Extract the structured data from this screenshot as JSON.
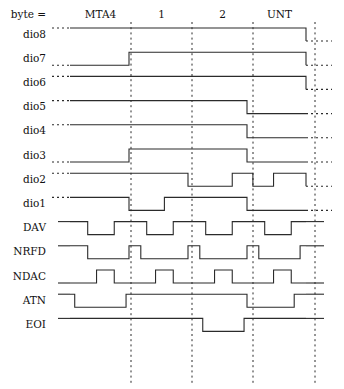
{
  "diagram": {
    "byte_header_label": "byte =",
    "byte_labels": [
      "MTA4",
      "1",
      "2",
      "UNT"
    ],
    "signal_labels": [
      "dio8",
      "dio7",
      "dio6",
      "dio5",
      "dio4",
      "dio3",
      "dio2",
      "dio1",
      "DAV",
      "NRFD",
      "NDAC",
      "ATN",
      "EOI"
    ],
    "colors": {
      "background": "#ffffff",
      "trace": "#2b2b2b",
      "text": "#111111",
      "divider": "#2b2b2b"
    },
    "geometry": {
      "wave_start_x": 70,
      "wave_end_x": 306,
      "lead_start_x": 52,
      "trail_end_x": 332,
      "byte_boundaries": [
        70,
        131,
        192,
        253,
        306
      ],
      "divider_x": [
        131,
        192,
        253,
        315
      ],
      "row_height": 24.2,
      "first_row_y": 41,
      "header_y": 15,
      "label_right_x": 46,
      "amplitude": 13
    },
    "chart_data": {
      "type": "line",
      "title": "GPIB bus signal timing",
      "xlabel": "byte",
      "ylabel": "signal",
      "categories": [
        "MTA4",
        "1",
        "2",
        "UNT"
      ],
      "note": "Each signal is a digital waveform. Transitions given as fractional position across the 4-byte span (0 = start, 4 = end); level 1 = high, 0 = low.",
      "series": [
        {
          "name": "dio8",
          "levels": [
            1,
            1,
            1,
            1
          ],
          "transitions": [
            [
              0,
              1
            ],
            [
              4,
              0
            ]
          ]
        },
        {
          "name": "dio7",
          "levels": [
            0,
            1,
            1,
            1
          ],
          "transitions": [
            [
              0,
              0
            ],
            [
              1,
              1
            ],
            [
              4,
              0
            ]
          ]
        },
        {
          "name": "dio6",
          "levels": [
            1,
            1,
            1,
            1
          ],
          "transitions": [
            [
              0,
              1
            ],
            [
              4,
              0
            ]
          ]
        },
        {
          "name": "dio5",
          "levels": [
            1,
            1,
            1,
            0
          ],
          "transitions": [
            [
              0,
              1
            ],
            [
              3,
              0
            ],
            [
              4,
              0
            ]
          ]
        },
        {
          "name": "dio4",
          "levels": [
            1,
            1,
            1,
            0
          ],
          "transitions": [
            [
              0,
              1
            ],
            [
              3,
              0
            ],
            [
              4,
              0
            ]
          ]
        },
        {
          "name": "dio3",
          "levels": [
            0,
            1,
            1,
            0
          ],
          "transitions": [
            [
              0,
              0
            ],
            [
              1,
              1
            ],
            [
              3,
              0
            ],
            [
              4,
              0
            ]
          ]
        },
        {
          "name": "dio2",
          "levels": [
            1,
            1,
            0,
            1
          ],
          "transitions": [
            [
              0,
              1
            ],
            [
              2,
              0
            ],
            [
              2.75,
              1
            ],
            [
              3.1,
              0
            ],
            [
              3.45,
              1
            ],
            [
              4,
              0
            ]
          ]
        },
        {
          "name": "dio1",
          "levels": [
            1,
            0,
            1,
            0
          ],
          "transitions": [
            [
              0,
              1
            ],
            [
              1,
              0
            ],
            [
              1.6,
              1
            ],
            [
              3,
              0
            ],
            [
              4,
              0
            ]
          ]
        },
        {
          "name": "DAV",
          "levels": [
            1,
            1,
            1,
            1
          ],
          "transitions": [
            [
              0,
              1
            ],
            [
              0.3,
              0
            ],
            [
              0.75,
              1
            ],
            [
              1.3,
              0
            ],
            [
              1.75,
              1
            ],
            [
              2.3,
              0
            ],
            [
              2.75,
              1
            ],
            [
              3.3,
              0
            ],
            [
              3.75,
              1
            ]
          ]
        },
        {
          "name": "NRFD",
          "levels": [
            1,
            1,
            1,
            1
          ],
          "transitions": [
            [
              0,
              1
            ],
            [
              0.3,
              0
            ],
            [
              1.0,
              1
            ],
            [
              1.2,
              0
            ],
            [
              2.0,
              1
            ],
            [
              2.2,
              0
            ],
            [
              3.0,
              1
            ],
            [
              3.2,
              0
            ],
            [
              3.9,
              1
            ]
          ]
        },
        {
          "name": "NDAC",
          "levels": [
            0,
            0,
            0,
            0
          ],
          "transitions": [
            [
              0,
              0
            ],
            [
              0.45,
              1
            ],
            [
              0.75,
              0
            ],
            [
              1.45,
              1
            ],
            [
              1.75,
              0
            ],
            [
              2.45,
              1
            ],
            [
              2.75,
              0
            ],
            [
              3.45,
              1
            ],
            [
              3.75,
              0
            ]
          ]
        },
        {
          "name": "ATN",
          "levels": [
            0,
            1,
            1,
            0
          ],
          "transitions": [
            [
              0,
              1
            ],
            [
              0.08,
              0
            ],
            [
              0.95,
              1
            ],
            [
              3.0,
              0
            ],
            [
              3.8,
              1
            ]
          ]
        },
        {
          "name": "EOI",
          "levels": [
            1,
            1,
            0,
            1
          ],
          "transitions": [
            [
              0,
              1
            ],
            [
              2.25,
              0
            ],
            [
              2.95,
              1
            ]
          ]
        }
      ]
    }
  }
}
